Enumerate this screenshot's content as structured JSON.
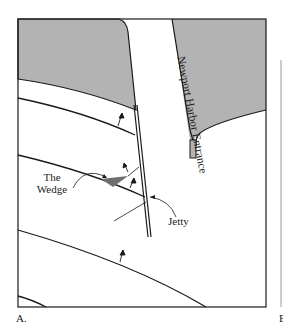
{
  "figure": {
    "panel_label": "A.",
    "adjacent_panel_label": "B",
    "labels": {
      "channel": "Newport Harbor Entrance",
      "wedge_line1": "The",
      "wedge_line2": "Wedge",
      "jetty": "Jetty"
    },
    "colors": {
      "land": "#b3b3b3",
      "wedge": "#6e6e6e",
      "line": "#1a1a1a",
      "background": "#ffffff"
    }
  }
}
